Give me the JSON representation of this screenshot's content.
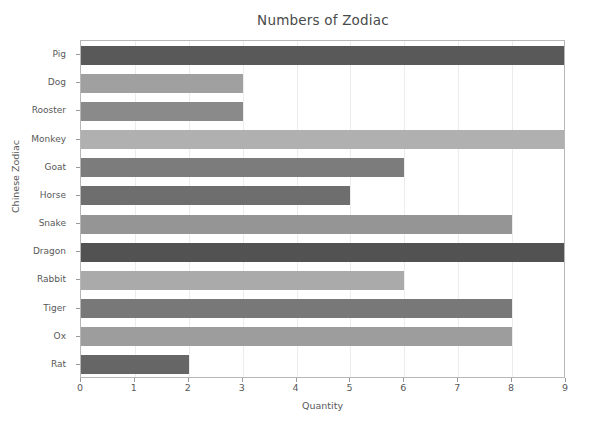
{
  "chart_data": {
    "type": "bar",
    "orientation": "horizontal",
    "title": "Numbers of Zodiac",
    "xlabel": "Quantity",
    "ylabel": "Chinese Zodiac",
    "xlim": [
      0,
      9
    ],
    "ylim": [
      0,
      12
    ],
    "xticks": [
      "0",
      "1",
      "2",
      "3",
      "4",
      "5",
      "6",
      "7",
      "8",
      "9"
    ],
    "grid": true,
    "grid_axis": "x",
    "legend": "none",
    "background_color": "#ffffff",
    "axes_edge_color": "#b7b7b7",
    "gridline_color": "#ececec",
    "tick_label_color": "#585858",
    "title_color": "#4a4a4a",
    "categories": [
      "Rat",
      "Ox",
      "Tiger",
      "Rabbit",
      "Dragon",
      "Snake",
      "Horse",
      "Goat",
      "Monkey",
      "Rooster",
      "Dog",
      "Pig"
    ],
    "values": [
      2,
      8,
      8,
      6,
      9,
      8,
      5,
      6,
      9,
      3,
      3,
      9
    ],
    "bars": [
      {
        "label": "Pig",
        "value": 9,
        "color": "#595959"
      },
      {
        "label": "Dog",
        "value": 3,
        "color": "#a0a0a0"
      },
      {
        "label": "Rooster",
        "value": 3,
        "color": "#8a8a8a"
      },
      {
        "label": "Monkey",
        "value": 9,
        "color": "#b0b0b0"
      },
      {
        "label": "Goat",
        "value": 6,
        "color": "#7c7c7c"
      },
      {
        "label": "Horse",
        "value": 5,
        "color": "#6e6e6e"
      },
      {
        "label": "Snake",
        "value": 8,
        "color": "#959595"
      },
      {
        "label": "Dragon",
        "value": 9,
        "color": "#525252"
      },
      {
        "label": "Rabbit",
        "value": 6,
        "color": "#aaaaaa"
      },
      {
        "label": "Tiger",
        "value": 8,
        "color": "#787878"
      },
      {
        "label": "Ox",
        "value": 8,
        "color": "#9d9d9d"
      },
      {
        "label": "Rat",
        "value": 2,
        "color": "#666666"
      }
    ]
  }
}
